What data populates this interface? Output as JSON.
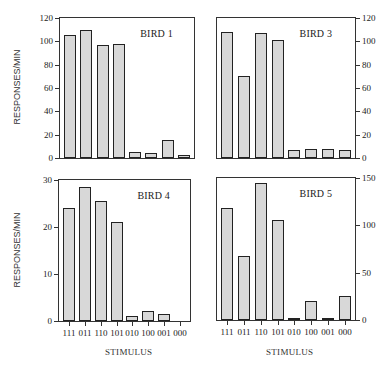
{
  "chart_data": [
    {
      "type": "bar",
      "title": "BIRD 1",
      "categories": [
        "111",
        "011",
        "110",
        "101",
        "010",
        "100",
        "001",
        "000"
      ],
      "values": [
        105,
        110,
        97,
        97.5,
        5.5,
        4.5,
        15,
        2.5
      ],
      "ylabel": "RESPONSES/MIN",
      "xlabel": "",
      "ylim": [
        0,
        120
      ],
      "yticks": [
        0,
        20,
        40,
        60,
        80,
        100,
        120
      ],
      "yaxis_side": "left",
      "grid": false
    },
    {
      "type": "bar",
      "title": "BIRD 3",
      "categories": [
        "111",
        "011",
        "110",
        "101",
        "010",
        "100",
        "001",
        "000"
      ],
      "values": [
        108,
        70,
        107,
        101,
        7,
        7.5,
        8,
        6.5
      ],
      "ylabel": "",
      "xlabel": "",
      "ylim": [
        0,
        120
      ],
      "yticks": [
        0,
        20,
        40,
        60,
        80,
        100,
        120
      ],
      "yaxis_side": "right",
      "grid": false
    },
    {
      "type": "bar",
      "title": "BIRD 4",
      "categories": [
        "111",
        "011",
        "110",
        "101",
        "010",
        "100",
        "001",
        "000"
      ],
      "values": [
        24,
        28.5,
        25.5,
        21,
        1,
        2.2,
        1.5,
        0
      ],
      "ylabel": "RESPONSES/MIN",
      "xlabel": "STIMULUS",
      "ylim": [
        0,
        30
      ],
      "yticks": [
        0,
        10,
        20,
        30
      ],
      "yaxis_side": "left",
      "grid": false
    },
    {
      "type": "bar",
      "title": "BIRD 5",
      "categories": [
        "111",
        "011",
        "110",
        "101",
        "010",
        "100",
        "001",
        "000"
      ],
      "values": [
        118,
        68,
        145,
        106,
        2,
        20,
        2,
        25
      ],
      "ylabel": "",
      "xlabel": "STIMULUS",
      "ylim": [
        0,
        150
      ],
      "yticks": [
        0,
        50,
        100,
        150
      ],
      "yaxis_side": "right",
      "grid": false
    }
  ],
  "labels": {
    "ylabel_top": "RESPONSES/MIN",
    "ylabel_bottom": "RESPONSES/MIN",
    "xlabel_left": "STIMULUS",
    "xlabel_right": "STIMULUS"
  },
  "colors": {
    "bar_fill": "#d8d8d8",
    "bar_dots": "#8a8a8a",
    "axis": "#333333"
  }
}
